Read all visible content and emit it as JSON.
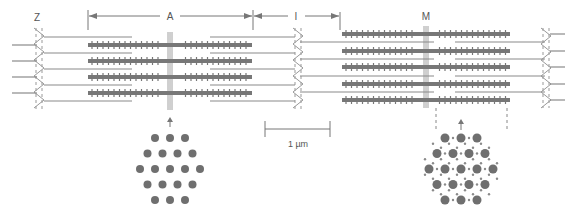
{
  "diagram": {
    "colors": {
      "thick_filament": "#777777",
      "thin_filament": "#8a8a8a",
      "z_disk": "#999999",
      "dimension_line": "#777777",
      "dot_large": "#6f6f6f",
      "dot_small": "#8a8a8a",
      "background": "#ffffff"
    },
    "labels": {
      "z": "Z",
      "a": "A",
      "i": "I",
      "m": "M",
      "scale": "1 µm"
    },
    "left_sarcomere": {
      "description": "Relaxed sarcomere with 4 thick filaments",
      "thick_filament_rows": 4,
      "cross_section": "Hexagonal lattice of thick filaments only (3-4-5-4-3)"
    },
    "right_sarcomere": {
      "description": "Overlapping region with 5 thick filaments",
      "thick_filament_rows": 5,
      "cross_section": "Hexagonal lattice of thick filaments with interdigitated thin filaments"
    }
  }
}
